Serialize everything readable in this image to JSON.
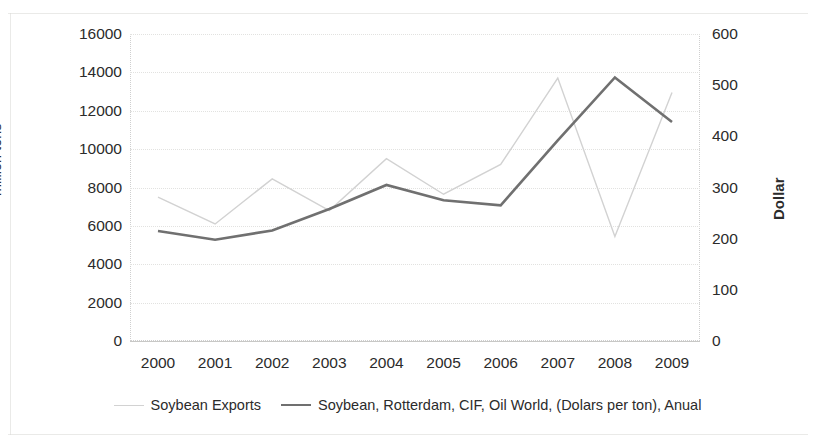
{
  "chart_data": {
    "type": "line",
    "title": "",
    "subtitle": "",
    "xlabel": "",
    "ylabel": "million tons",
    "ylabel_secondary": "Dollar",
    "categories": [
      "2000",
      "2001",
      "2002",
      "2003",
      "2004",
      "2005",
      "2006",
      "2007",
      "2008",
      "2009"
    ],
    "x_tick_labels": [
      "2000",
      "2001",
      "2002",
      "2003",
      "2004",
      "2005",
      "2006",
      "2007",
      "2008",
      "2009"
    ],
    "y_tick_labels": [
      "16000",
      "14000",
      "12000",
      "10000",
      "8000",
      "6000",
      "4000",
      "2000",
      "0"
    ],
    "y_tick_values": [
      16000,
      14000,
      12000,
      10000,
      8000,
      6000,
      4000,
      2000,
      0
    ],
    "y2_tick_labels": [
      "600",
      "500",
      "400",
      "300",
      "200",
      "100",
      "0"
    ],
    "y2_tick_values": [
      600,
      500,
      400,
      300,
      200,
      100,
      0
    ],
    "ylim": [
      0,
      16000
    ],
    "ylim_secondary": [
      0,
      600
    ],
    "grid": true,
    "legend_position": "bottom",
    "series": [
      {
        "name": "Soybean Exports",
        "axis": "left",
        "unit": "million tons",
        "color": "#d2d2d2",
        "line_width": 1.4,
        "values": [
          7500,
          6100,
          8450,
          6800,
          9500,
          7650,
          9200,
          13700,
          5450,
          12950
        ]
      },
      {
        "name": "Soybean, Rotterdam, CIF, Oil World, (Dolars per ton), Anual",
        "axis": "right",
        "unit": "Dollar",
        "color": "#707070",
        "line_width": 2.6,
        "values": [
          215,
          198,
          216,
          258,
          305,
          275,
          265,
          392,
          515,
          428
        ]
      }
    ]
  },
  "legend": {
    "items": [
      {
        "label": "Soybean Exports",
        "color": "#d2d2d2",
        "thickness": "1.6px"
      },
      {
        "label": "Soybean, Rotterdam, CIF, Oil World, (Dolars per ton), Anual",
        "color": "#707070",
        "thickness": "2.8px"
      }
    ]
  },
  "axes": {
    "left_title": "million tons",
    "right_title": "Dollar"
  }
}
